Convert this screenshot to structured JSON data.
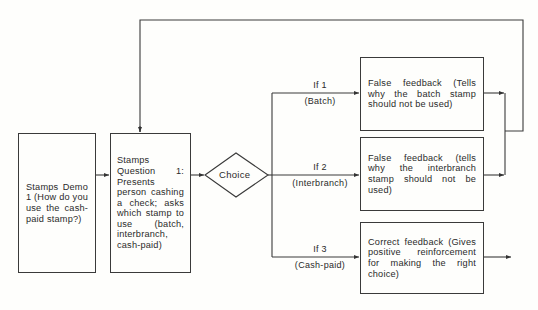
{
  "diagram": {
    "nodes": [
      {
        "id": "demo",
        "text": "Stamps Demo 1 (How do you use the cash-paid stamp?)"
      },
      {
        "id": "question",
        "text": "Stamps Question 1: Presents person cashing a check; asks which stamp to use (batch, interbranch, cash-paid)"
      },
      {
        "id": "choice",
        "text": "Choice"
      },
      {
        "id": "fb1",
        "text": "False feedback (Tells why the batch stamp should not be used)"
      },
      {
        "id": "fb2",
        "text": "False feedback (tells why the interbranch stamp should not be used)"
      },
      {
        "id": "fb3",
        "text": "Correct feedback (Gives positive reinforcement for making the right choice)"
      }
    ],
    "edges": [
      {
        "from": "demo",
        "to": "question"
      },
      {
        "from": "question",
        "to": "choice"
      },
      {
        "from": "choice",
        "to": "fb1",
        "condition": "If 1",
        "sublabel": "(Batch)"
      },
      {
        "from": "choice",
        "to": "fb2",
        "condition": "If 2",
        "sublabel": "(Interbranch)"
      },
      {
        "from": "choice",
        "to": "fb3",
        "condition": "If 3",
        "sublabel": "(Cash-paid)"
      },
      {
        "from": "fb1",
        "to": "question",
        "note": "loop back"
      },
      {
        "from": "fb2",
        "to": "question",
        "note": "loop back"
      },
      {
        "from": "fb3",
        "to": "next",
        "note": "exit arrow"
      }
    ]
  },
  "labels": {
    "demo": "Stamps Demo 1 (How do you use the cash-paid stamp?)",
    "question": "Stamps Question 1: Presents person cashing a check; asks which stamp to use (batch, interbranch, cash-paid)",
    "choice": "Choice",
    "fb1": "False feedback (Tells why the batch stamp should not be used)",
    "fb2": "False feedback (tells why the interbranch stamp should not be used)",
    "fb3": "Correct feedback (Gives positive reinforcement for making the right choice)",
    "if1": "If 1",
    "if1_sub": "(Batch)",
    "if2": "If 2",
    "if2_sub": "(Interbranch)",
    "if3": "If 3",
    "if3_sub": "(Cash-paid)"
  }
}
